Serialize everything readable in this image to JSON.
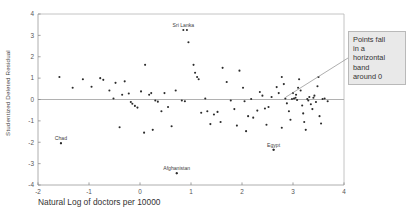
{
  "chart_data": {
    "type": "scatter",
    "title": "",
    "xlabel": "Natural Log of doctors per 10000",
    "ylabel": "Studentized Deleted Residual",
    "xlim": [
      -2,
      4
    ],
    "ylim": [
      -4,
      4
    ],
    "xticks": [
      -2,
      -1,
      0,
      1,
      2,
      3,
      4
    ],
    "yticks": [
      -4,
      -3,
      -2,
      -1,
      0,
      1,
      2,
      3,
      4
    ],
    "xtick_labels": [
      "-2",
      "-1",
      "0",
      "1",
      "2",
      "3",
      "4"
    ],
    "ytick_labels": [
      "-4",
      "-3",
      "-2",
      "-1",
      "0",
      "1",
      "2",
      "3",
      "4"
    ],
    "grid": false,
    "reference_line_y": 0,
    "legend": null,
    "annotations": [
      {
        "name": "Sri Lanka",
        "x": 0.85,
        "y": 3.25
      },
      {
        "name": "Chad",
        "x": -1.55,
        "y": -2.05
      },
      {
        "name": "Afghanistan",
        "x": 0.72,
        "y": -3.45
      },
      {
        "name": "Egypt",
        "x": 2.62,
        "y": -2.35
      }
    ],
    "callout_text": "Points fall in a horizontal band around 0",
    "points": [
      [
        -1.58,
        1.05
      ],
      [
        -1.32,
        0.55
      ],
      [
        -1.12,
        0.95
      ],
      [
        -0.95,
        0.6
      ],
      [
        -0.78,
        1.0
      ],
      [
        -0.72,
        0.92
      ],
      [
        -0.6,
        0.42
      ],
      [
        -0.52,
        0.05
      ],
      [
        -0.48,
        0.78
      ],
      [
        -0.35,
        0.22
      ],
      [
        -0.3,
        0.85
      ],
      [
        -0.22,
        0.28
      ],
      [
        -0.18,
        -0.12
      ],
      [
        -0.15,
        -0.2
      ],
      [
        -0.1,
        -0.3
      ],
      [
        0.02,
        0.38
      ],
      [
        0.1,
        1.62
      ],
      [
        0.18,
        0.22
      ],
      [
        0.22,
        0.3
      ],
      [
        0.3,
        -0.05
      ],
      [
        0.35,
        -0.1
      ],
      [
        0.42,
        -0.55
      ],
      [
        0.55,
        -0.35
      ],
      [
        0.7,
        0.42
      ],
      [
        0.82,
        -0.05
      ],
      [
        0.88,
        -0.08
      ],
      [
        0.92,
        3.25
      ],
      [
        0.95,
        2.68
      ],
      [
        1.05,
        1.62
      ],
      [
        1.08,
        1.25
      ],
      [
        1.12,
        1.05
      ],
      [
        1.15,
        0.95
      ],
      [
        1.2,
        -0.62
      ],
      [
        1.32,
        -0.55
      ],
      [
        1.45,
        -0.7
      ],
      [
        1.52,
        -0.58
      ],
      [
        1.62,
        1.48
      ],
      [
        1.7,
        0.82
      ],
      [
        1.78,
        -0.05
      ],
      [
        1.85,
        -0.45
      ],
      [
        1.95,
        1.35
      ],
      [
        2.02,
        0.55
      ],
      [
        2.05,
        -0.08
      ],
      [
        2.12,
        -0.78
      ],
      [
        2.22,
        -0.85
      ],
      [
        2.3,
        -0.52
      ],
      [
        2.35,
        0.35
      ],
      [
        2.4,
        0.18
      ],
      [
        2.45,
        -0.42
      ],
      [
        2.52,
        -0.35
      ],
      [
        2.58,
        0.12
      ],
      [
        2.62,
        -2.35
      ],
      [
        2.68,
        0.58
      ],
      [
        2.72,
        0.3
      ],
      [
        2.78,
        1.05
      ],
      [
        2.82,
        0.72
      ],
      [
        2.85,
        0.05
      ],
      [
        2.88,
        -0.18
      ],
      [
        2.92,
        -0.55
      ],
      [
        2.95,
        -0.95
      ],
      [
        2.98,
        0.02
      ],
      [
        3.02,
        0.05
      ],
      [
        3.05,
        0.08
      ],
      [
        3.08,
        -0.02
      ],
      [
        3.1,
        0.55
      ],
      [
        3.12,
        0.95
      ],
      [
        3.15,
        0.42
      ],
      [
        3.18,
        -0.28
      ],
      [
        3.2,
        -0.65
      ],
      [
        3.22,
        -1.05
      ],
      [
        3.25,
        -1.42
      ],
      [
        3.28,
        0.02
      ],
      [
        3.3,
        -0.05
      ],
      [
        3.32,
        0.12
      ],
      [
        3.35,
        -0.22
      ],
      [
        3.38,
        -0.45
      ],
      [
        3.4,
        0.08
      ],
      [
        3.42,
        0.18
      ],
      [
        3.45,
        -0.12
      ],
      [
        3.48,
        0.62
      ],
      [
        3.5,
        1.05
      ],
      [
        3.52,
        -0.78
      ],
      [
        3.55,
        -1.12
      ],
      [
        3.58,
        0.02
      ],
      [
        3.62,
        0.05
      ],
      [
        3.68,
        -0.08
      ],
      [
        -1.55,
        -2.05
      ],
      [
        0.72,
        -3.45
      ],
      [
        -0.05,
        -0.38
      ],
      [
        0.48,
        0.3
      ],
      [
        1.28,
        0.05
      ],
      [
        2.18,
        0.02
      ],
      [
        1.38,
        -1.15
      ],
      [
        1.58,
        -1.05
      ],
      [
        0.62,
        -1.25
      ],
      [
        0.25,
        -1.42
      ],
      [
        -0.4,
        -1.3
      ],
      [
        0.08,
        -1.55
      ],
      [
        1.9,
        -1.22
      ],
      [
        2.08,
        -1.48
      ],
      [
        2.48,
        -1.18
      ],
      [
        2.78,
        -1.32
      ],
      [
        3.0,
        0.3
      ],
      [
        3.06,
        0.22
      ]
    ]
  },
  "axis": {
    "y_title": "Studentized Deleted Residual",
    "x_title": "Natural Log of doctors per 10000"
  },
  "callout": {
    "line1": "Points fall",
    "line2": "in a",
    "line3": "horizontal",
    "line4": "band",
    "line5": "around 0"
  }
}
